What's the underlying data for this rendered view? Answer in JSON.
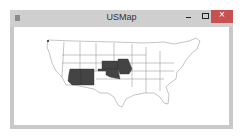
{
  "window": {
    "title": "USMap",
    "buttons": {
      "minimize": "minimize",
      "maximize": "maximize",
      "close": "close"
    },
    "colors": {
      "titlebar": "#cfcfcf",
      "close": "#c75050",
      "highlight": "#444444"
    }
  },
  "map": {
    "highlighted_states": [
      "Arizona",
      "New Mexico",
      "Kansas",
      "Oklahoma",
      "Missouri"
    ]
  }
}
